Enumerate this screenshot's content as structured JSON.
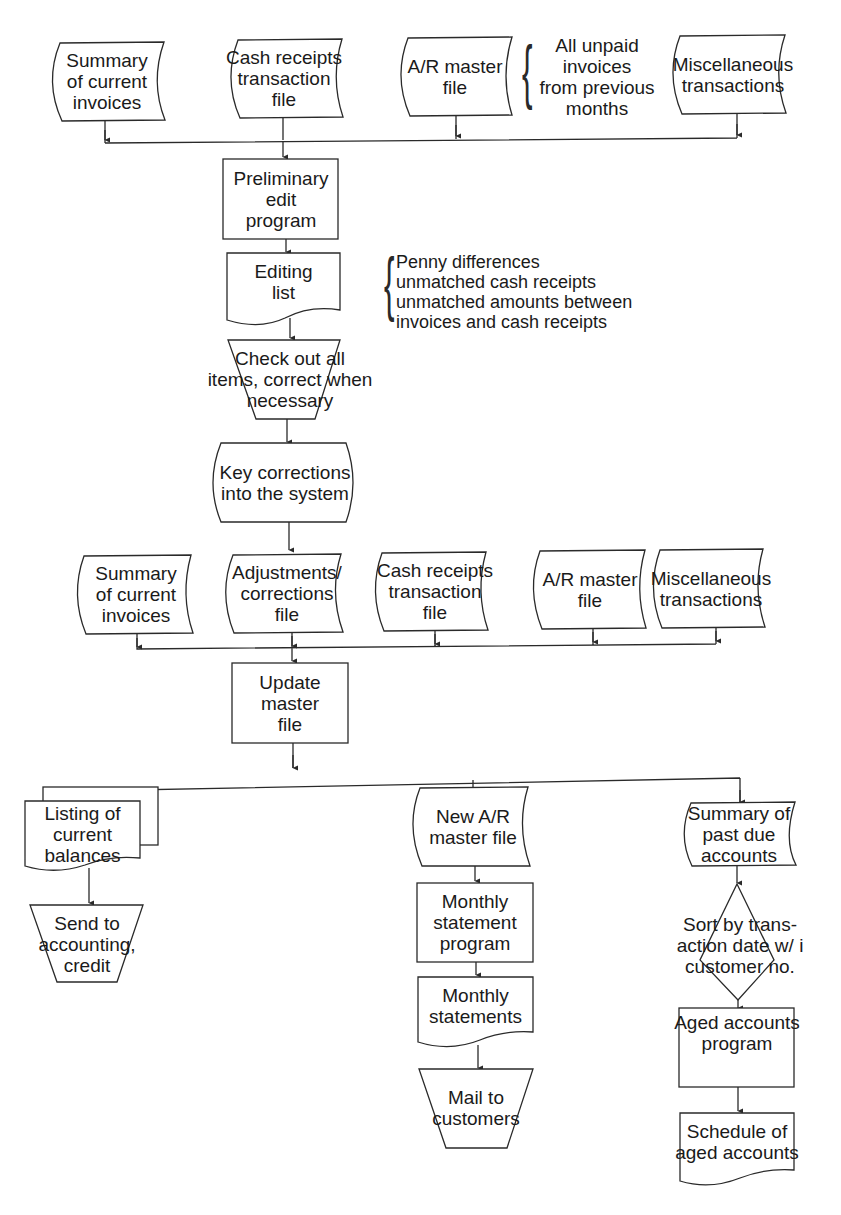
{
  "diagram": {
    "type": "system-flowchart",
    "inputs_top": {
      "summary_invoices": "Summary\nof current\ninvoices",
      "cash_receipts": "Cash receipts\ntransaction\nfile",
      "ar_master": "A/R master\nfile",
      "ar_master_note": "All unpaid\ninvoices\nfrom previous\nmonths",
      "misc": "Miscellaneous\ntransactions"
    },
    "preliminary_edit": "Preliminary\nedit\nprogram",
    "editing_list": "Editing\nlist",
    "editing_list_note": "Penny differences\nunmatched cash receipts\nunmatched amounts between\ninvoices and cash receipts",
    "check_out": "Check out all\nitems, correct when\nnecessary",
    "key_corrections": "Key corrections\ninto the system",
    "inputs_update": {
      "summary_invoices": "Summary\nof current\ninvoices",
      "adjustments": "Adjustments/\ncorrections\nfile",
      "cash_receipts": "Cash receipts\ntransaction\nfile",
      "ar_master": "A/R master\nfile",
      "misc": "Miscellaneous\ntransactions"
    },
    "update_master": "Update\nmaster\nfile",
    "outputs": {
      "listing_balances": "Listing of\ncurrent\nbalances",
      "send_accounting": "Send to\naccounting,\ncredit",
      "new_ar_master": "New A/R\nmaster file",
      "monthly_statement_program": "Monthly\nstatement\nprogram",
      "monthly_statements": "Monthly\nstatements",
      "mail_customers": "Mail to\ncustomers",
      "summary_past_due": "Summary of\npast due\naccounts",
      "sort": "Sort by trans-\naction date w/ i\ncustomer no.",
      "aged_program": "Aged accounts\nprogram",
      "schedule_aged": "Schedule of\naged accounts"
    }
  }
}
